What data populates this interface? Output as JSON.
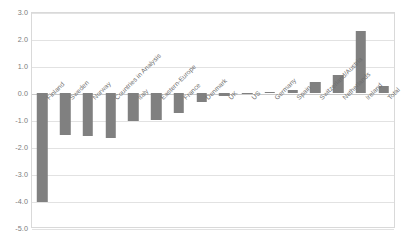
{
  "chart_data": {
    "type": "bar",
    "title": "",
    "subtitle": "",
    "xlabel": "",
    "ylabel": "",
    "ylim": [
      -5.0,
      3.0
    ],
    "ytick_step": 1.0,
    "yticks": [
      "3.0",
      "2.0",
      "1.0",
      "0.0",
      "-1.0",
      "-2.0",
      "-3.0",
      "-4.0",
      "-5.0"
    ],
    "ytick_values": [
      3.0,
      2.0,
      1.0,
      0.0,
      -1.0,
      -2.0,
      -3.0,
      -4.0,
      -5.0
    ],
    "grid": true,
    "legend": "none",
    "bar_color": "#808080",
    "categories": [
      "Finland",
      "Sweden",
      "Norway",
      "Countries in Analysis",
      "Italy",
      "Eastern-Europe",
      "France",
      "Denmark",
      "UK",
      "US",
      "Germany",
      "Spain",
      "Switzerland/Austria",
      "Netherlands",
      "Ireland",
      "Total"
    ],
    "values": [
      -4.05,
      -1.55,
      -1.6,
      -1.65,
      -1.05,
      -1.0,
      -0.75,
      -0.35,
      -0.1,
      -0.05,
      0.05,
      0.1,
      0.4,
      0.65,
      2.3,
      0.25
    ]
  },
  "axis": {
    "y_axis_name": "value-axis",
    "x_axis_name": "category-axis"
  }
}
